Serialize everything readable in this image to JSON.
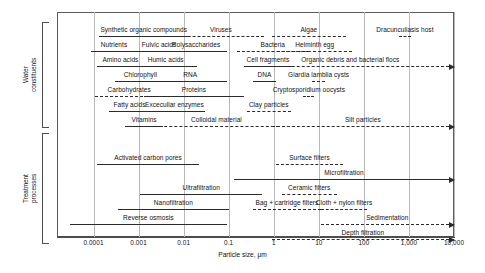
{
  "figure": {
    "xaxis_title": "Particle size, μm",
    "ticks": [
      {
        "label": "0.0001",
        "value": 0.0001
      },
      {
        "label": "0.001",
        "value": 0.001
      },
      {
        "label": "0.01",
        "value": 0.01
      },
      {
        "label": "0.1",
        "value": 0.1
      },
      {
        "label": "1",
        "value": 1
      },
      {
        "label": "10",
        "value": 10
      },
      {
        "label": "100",
        "value": 100
      },
      {
        "label": "1,000",
        "value": 1000
      },
      {
        "label": "10,000",
        "value": 10000
      }
    ],
    "xmin": 3e-05,
    "xmax": 10000
  },
  "groups": [
    {
      "name": "water-constituents",
      "label": "Water\nconstituents",
      "top": 22,
      "bottom": 128
    },
    {
      "name": "treatment-processes",
      "label": "Treatment\nprocesses",
      "top": 133,
      "bottom": 244
    }
  ],
  "chart_data": {
    "type": "range-bar",
    "title": "",
    "xlabel": "Particle size, μm",
    "xscale": "log",
    "xlim": [
      3e-05,
      10000
    ],
    "grid": true,
    "series": [
      {
        "group": "Water constituents",
        "row": 0,
        "name": "Synthetic organic compounds",
        "min": 0.00013,
        "max": 0.013,
        "style": "solid",
        "arrow": false
      },
      {
        "group": "Water constituents",
        "row": 0,
        "name": "Viruses",
        "min": 0.0075,
        "max": 0.6,
        "style": "dashed",
        "arrow": false
      },
      {
        "group": "Water constituents",
        "row": 0,
        "name": "Algae",
        "min": 0.9,
        "max": 40,
        "style": "dashed",
        "arrow": false
      },
      {
        "group": "Water constituents",
        "row": 0,
        "name": "Dracunculiasis host",
        "min": 600,
        "max": 1100,
        "style": "dashed",
        "arrow": false
      },
      {
        "group": "Water constituents",
        "row": 1,
        "name": "Nutrients",
        "min": 9e-05,
        "max": 0.0009,
        "style": "solid",
        "arrow": false
      },
      {
        "group": "Water constituents",
        "row": 1,
        "name": "Fulvic acids",
        "min": 0.0009,
        "max": 0.009,
        "style": "solid",
        "arrow": false
      },
      {
        "group": "Water constituents",
        "row": 1,
        "name": "Polysaccharides",
        "min": 0.004,
        "max": 0.09,
        "style": "solid",
        "arrow": false
      },
      {
        "group": "Water constituents",
        "row": 1,
        "name": "Bacteria",
        "min": 0.15,
        "max": 6,
        "style": "dashed",
        "arrow": false
      },
      {
        "group": "Water constituents",
        "row": 1,
        "name": "Helminth egg",
        "min": 1.2,
        "max": 55,
        "style": "dashed",
        "arrow": false
      },
      {
        "group": "Water constituents",
        "row": 2,
        "name": "Amino acids",
        "min": 0.00012,
        "max": 0.0013,
        "style": "solid",
        "arrow": false
      },
      {
        "group": "Water constituents",
        "row": 2,
        "name": "Humic acids",
        "min": 0.0008,
        "max": 0.02,
        "style": "solid",
        "arrow": false
      },
      {
        "group": "Water constituents",
        "row": 2,
        "name": "Cell fragments",
        "min": 0.22,
        "max": 2.5,
        "style": "solid",
        "arrow": false
      },
      {
        "group": "Water constituents",
        "row": 2,
        "name": "Organic debris and bacterial flocs",
        "min": 0.25,
        "max": 10000,
        "style": "dashed",
        "arrow": true
      },
      {
        "group": "Water constituents",
        "row": 3,
        "name": "Chlorophyll",
        "min": 0.0003,
        "max": 0.004,
        "style": "solid",
        "arrow": false
      },
      {
        "group": "Water constituents",
        "row": 3,
        "name": "RNA",
        "min": 0.0022,
        "max": 0.09,
        "style": "solid",
        "arrow": false
      },
      {
        "group": "Water constituents",
        "row": 3,
        "name": "DNA",
        "min": 0.35,
        "max": 1.1,
        "style": "solid",
        "arrow": false
      },
      {
        "group": "Water constituents",
        "row": 3,
        "name": "Giardia lamblia cysts",
        "min": 7,
        "max": 14,
        "style": "dashed",
        "arrow": false
      },
      {
        "group": "Water constituents",
        "row": 4,
        "name": "Carbohydrates",
        "min": 0.00011,
        "max": 0.0035,
        "style": "dashed",
        "arrow": false
      },
      {
        "group": "Water constituents",
        "row": 4,
        "name": "Proteins",
        "min": 0.0013,
        "max": 0.22,
        "style": "solid",
        "arrow": false
      },
      {
        "group": "Water constituents",
        "row": 4,
        "name": "Cryptosporidium oocysts",
        "min": 4.5,
        "max": 8,
        "style": "dashed",
        "arrow": false
      },
      {
        "group": "Water constituents",
        "row": 5,
        "name": "Fatty acids",
        "min": 0.00022,
        "max": 0.0018,
        "style": "solid",
        "arrow": false
      },
      {
        "group": "Water constituents",
        "row": 5,
        "name": "Excecullar enzymes",
        "min": 0.0013,
        "max": 0.03,
        "style": "solid",
        "arrow": false
      },
      {
        "group": "Water constituents",
        "row": 5,
        "name": "Clay particles",
        "min": 0.25,
        "max": 2.4,
        "style": "dashed",
        "arrow": false
      },
      {
        "group": "Water constituents",
        "row": 6,
        "name": "Vitamins",
        "min": 0.0005,
        "max": 0.0035,
        "style": "solid",
        "arrow": false
      },
      {
        "group": "Water constituents",
        "row": 6,
        "name": "Colloidal material",
        "min": 0.0022,
        "max": 1.3,
        "style": "dashed",
        "arrow": false
      },
      {
        "group": "Water constituents",
        "row": 6,
        "name": "Silt particles",
        "min": 0.9,
        "max": 10000,
        "style": "dashed",
        "arrow": true
      },
      {
        "group": "Treatment processes",
        "row": 0,
        "name": "Activated carbon pores",
        "min": 0.00012,
        "max": 0.022,
        "style": "solid",
        "arrow": false
      },
      {
        "group": "Treatment processes",
        "row": 0,
        "name": "Surface filters",
        "min": 1.1,
        "max": 35,
        "style": "dashed",
        "arrow": false
      },
      {
        "group": "Treatment processes",
        "row": 1,
        "name": "Microfiltration",
        "min": 0.13,
        "max": 10000,
        "style": "solid",
        "arrow": true
      },
      {
        "group": "Treatment processes",
        "row": 2,
        "name": "Ultrafiltration",
        "min": 0.0011,
        "max": 0.55,
        "style": "solid",
        "arrow": false
      },
      {
        "group": "Treatment processes",
        "row": 2,
        "name": "Ceramic filters",
        "min": 1.5,
        "max": 25,
        "style": "dashed",
        "arrow": false
      },
      {
        "group": "Treatment processes",
        "row": 3,
        "name": "Nanofiltration",
        "min": 0.00035,
        "max": 0.1,
        "style": "solid",
        "arrow": false
      },
      {
        "group": "Treatment processes",
        "row": 3,
        "name": "Bag + cartridge filters",
        "min": 0.35,
        "max": 11,
        "style": "dashed",
        "arrow": false
      },
      {
        "group": "Treatment processes",
        "row": 3,
        "name": "Cloth + nylon filters",
        "min": 11,
        "max": 120,
        "style": "dashed",
        "arrow": false
      },
      {
        "group": "Treatment processes",
        "row": 4,
        "name": "Reverse osmosis",
        "min": 3e-05,
        "max": 0.09,
        "style": "solid",
        "arrow": false
      },
      {
        "group": "Treatment processes",
        "row": 4,
        "name": "Sedimentation",
        "min": 11,
        "max": 10000,
        "style": "dashed",
        "arrow": true
      },
      {
        "group": "Treatment processes",
        "row": 5,
        "name": "Depth filtration",
        "min": 0.9,
        "max": 10000,
        "style": "dashed",
        "arrow": true
      }
    ]
  },
  "rows": {
    "water_y": [
      24,
      39,
      54,
      69,
      84,
      99,
      114
    ],
    "treatment_y": [
      152,
      167,
      182,
      197,
      212,
      227
    ]
  }
}
